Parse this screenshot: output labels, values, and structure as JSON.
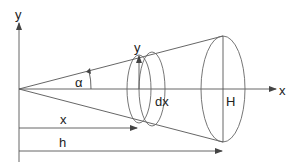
{
  "diagram": {
    "title": "",
    "labels": {
      "y_axis": "y",
      "x_axis": "x",
      "radius_y": "y",
      "angle": "α",
      "slice_width": "dx",
      "base_radius": "H",
      "position_x": "x",
      "height_h": "h"
    },
    "colors": {
      "line": "#555555",
      "text": "#222222",
      "background": "#ffffff"
    },
    "geometry": {
      "apex": [
        19,
        89
      ],
      "y_axis_top": [
        19,
        22
      ],
      "x_axis_end": [
        275,
        89
      ],
      "large_ellipse": {
        "cx": 223,
        "cy": 89,
        "rx": 22,
        "ry": 53
      },
      "slice_ellipse_left": {
        "cx": 139,
        "cy": 89,
        "rx": 12,
        "ry": 34
      },
      "slice_ellipse_right": {
        "cx": 152,
        "cy": 89,
        "rx": 13,
        "ry": 37
      }
    }
  }
}
